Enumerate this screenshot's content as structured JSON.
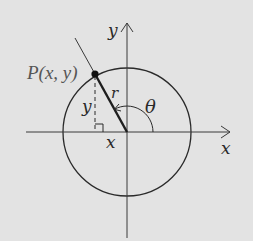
{
  "diagram": {
    "type": "unit-circle-angle",
    "background_color": "#e3e3e3",
    "stroke_color": "#2a2a2a",
    "labels": {
      "point": "P(x, y)",
      "y_axis": "y",
      "x_axis": "x",
      "radius": "r",
      "angle": "θ",
      "x_leg": "x",
      "y_leg": "y"
    },
    "geometry": {
      "origin": [
        127,
        132
      ],
      "circle_radius": 64,
      "point_P": [
        95,
        74
      ],
      "angle_theta_deg": 119
    }
  }
}
